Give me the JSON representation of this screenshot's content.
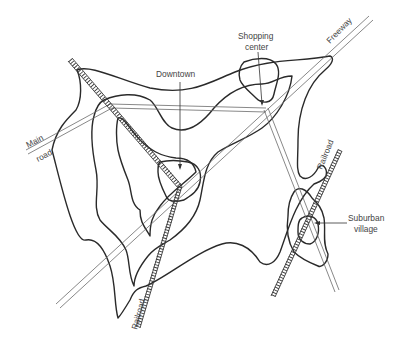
{
  "diagram": {
    "labels": {
      "downtown": "Downtown",
      "shopping_line1": "Shopping",
      "shopping_line2": "center",
      "freeway": "Freeway",
      "main_road_line1": "Main",
      "main_road_line2": "road",
      "railroad_left": "Railroad",
      "railroad_right": "Railroad",
      "suburban_line1": "Suburban",
      "suburban_line2": "village"
    },
    "colors": {
      "contour": "#2a2a2a",
      "road": "#6a6a6a",
      "railroad": "#3a3a3a",
      "text": "#444444",
      "background": "#ffffff"
    }
  }
}
